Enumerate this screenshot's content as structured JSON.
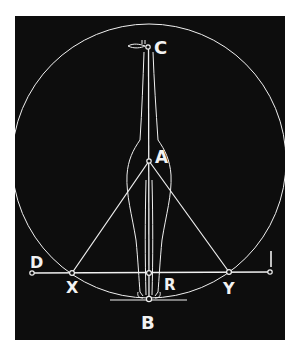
{
  "figure": {
    "background": "#0d0d0d",
    "line_color": "#f0f0f0",
    "points": {
      "C": {
        "label": "C",
        "x": 148,
        "y": 47
      },
      "A": {
        "label": "A",
        "x": 149,
        "y": 161
      },
      "D": {
        "label": "D",
        "x": 32,
        "y": 273
      },
      "X": {
        "label": "X",
        "x": 72,
        "y": 273
      },
      "R": {
        "label": "R",
        "x": 149,
        "y": 273
      },
      "Y": {
        "label": "Y",
        "x": 229,
        "y": 272
      },
      "I": {
        "label": "I",
        "x": 270,
        "y": 272
      },
      "B": {
        "label": "B",
        "x": 149,
        "y": 299
      }
    },
    "circle": {
      "cx": 149,
      "cy": 161,
      "r": 137
    }
  }
}
